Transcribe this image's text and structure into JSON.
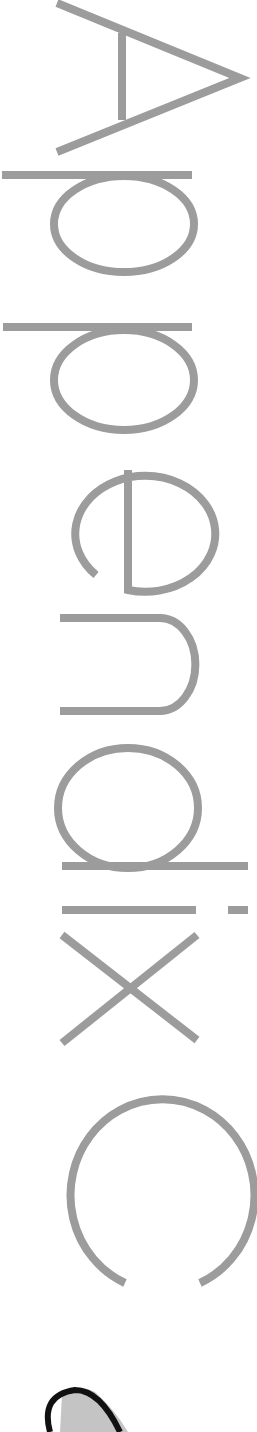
{
  "page": {
    "heading": "Appendix C",
    "orientation": "rotated-90-clockwise",
    "colors": {
      "letter_stroke": "#9c9c9c",
      "background": "#ffffff",
      "ornament_outline": "#111111",
      "ornament_fill": "#c4c4c4"
    },
    "ornament": "partial-drawing-at-bottom"
  }
}
